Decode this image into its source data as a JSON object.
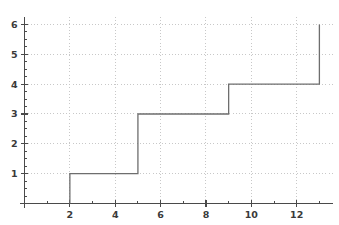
{
  "chart_data": {
    "type": "line",
    "title": "",
    "subtitle": "",
    "xlabel": "",
    "ylabel": "",
    "legend": [],
    "grid": true,
    "grid_style": "dotted",
    "line_style": "step-post",
    "xlim": [
      0,
      13.6
    ],
    "ylim": [
      0,
      6.25
    ],
    "x_ticks": [
      2,
      4,
      6,
      8,
      10,
      12
    ],
    "x_tick_labels": [
      "2",
      "4",
      "6",
      "8",
      "10",
      "12"
    ],
    "x_minor_ticks": [
      1,
      3,
      5,
      7,
      9,
      11,
      13
    ],
    "y_ticks": [
      1,
      2,
      3,
      4,
      5,
      6
    ],
    "y_tick_labels": [
      "1",
      "2",
      "3",
      "4",
      "5",
      "6"
    ],
    "y_minor_step": 0.25,
    "x_gridlines": [
      2,
      4,
      6,
      8,
      10,
      12
    ],
    "y_gridlines": [
      1,
      2,
      3,
      4,
      5,
      6
    ],
    "series": [
      {
        "name": "step",
        "color": "#6e6e6e",
        "step_points": [
          {
            "x": 2,
            "y": 0
          },
          {
            "x": 2,
            "y": 1
          },
          {
            "x": 5,
            "y": 1
          },
          {
            "x": 5,
            "y": 3
          },
          {
            "x": 9,
            "y": 3
          },
          {
            "x": 9,
            "y": 4
          },
          {
            "x": 13,
            "y": 4
          },
          {
            "x": 13,
            "y": 6
          }
        ],
        "jumps": [
          {
            "x": 2,
            "from": 0,
            "to": 1
          },
          {
            "x": 5,
            "from": 1,
            "to": 3
          },
          {
            "x": 9,
            "from": 3,
            "to": 4
          },
          {
            "x": 13,
            "from": 4,
            "to": 6
          }
        ]
      }
    ]
  },
  "colors": {
    "background": "#ffffff",
    "axis": "#4a4a4a",
    "grid": "#c8c8c8",
    "line": "#6e6e6e",
    "text": "#3a3a3a"
  },
  "labels": {
    "y": [
      "1",
      "2",
      "3",
      "4",
      "5",
      "6"
    ],
    "x": [
      "2",
      "4",
      "6",
      "8",
      "10",
      "12"
    ]
  }
}
